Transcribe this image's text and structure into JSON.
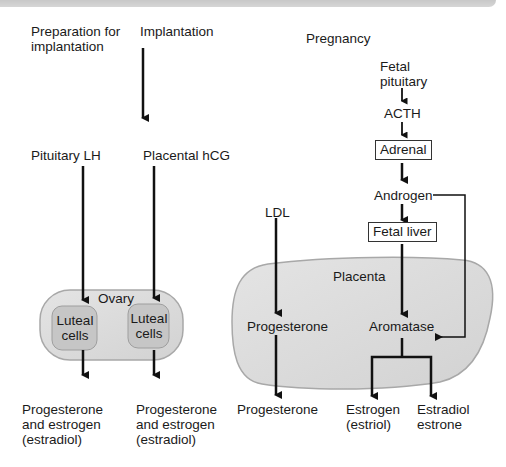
{
  "colors": {
    "ink": "#111111",
    "organ_fill": "#d9d9d9",
    "organ_stroke": "#a8a8a8",
    "cell_fill": "#c4c4c4",
    "header_bar": "#cfcfcf"
  },
  "columns": {
    "prep": {
      "heading_line1": "Preparation for",
      "heading_line2": "implantation",
      "hormone": "Pituitary LH",
      "output_line1": "Progesterone",
      "output_line2": "and estrogen",
      "output_line3": "(estradiol)"
    },
    "implant": {
      "heading": "Implantation",
      "hormone": "Placental hCG",
      "output_line1": "Progesterone",
      "output_line2": "and estrogen",
      "output_line3": "(estradiol)"
    },
    "pregnancy": {
      "heading": "Pregnancy",
      "fetal_pituitary_line1": "Fetal",
      "fetal_pituitary_line2": "pituitary",
      "acth": "ACTH",
      "adrenal": "Adrenal",
      "androgen": "Androgen",
      "fetal_liver": "Fetal liver",
      "ldl": "LDL",
      "placenta": "Placenta",
      "progesterone_inner": "Progesterone",
      "aromatase": "Aromatase",
      "progesterone_out": "Progesterone",
      "estrogen_line1": "Estrogen",
      "estrogen_line2": "(estriol)",
      "estradiol_line1": "Estradiol",
      "estradiol_line2": "estrone"
    }
  },
  "ovary": {
    "label": "Ovary",
    "luteal_left_line1": "Luteal",
    "luteal_left_line2": "cells",
    "luteal_right_line1": "Luteal",
    "luteal_right_line2": "cells"
  }
}
